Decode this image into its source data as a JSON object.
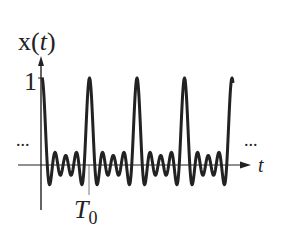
{
  "diagram": {
    "y_label_main": "x(",
    "y_label_var": "t",
    "y_label_close": ")",
    "y_tick_one": "1",
    "x_axis_label": "t",
    "period_label_main": "T",
    "period_label_sub": "0",
    "ellipsis_left": "...",
    "ellipsis_right": "...",
    "stroke_color": "#222222"
  },
  "chart_data": {
    "type": "line",
    "xlabel": "t",
    "ylabel": "x(t)",
    "ytick": [
      1
    ],
    "xtick": [
      "T0"
    ],
    "periodic": true,
    "peaks_per_view": 5,
    "peak_value": 1,
    "ripples_between_peaks": 3,
    "grid": false,
    "continues_both_directions": true
  }
}
